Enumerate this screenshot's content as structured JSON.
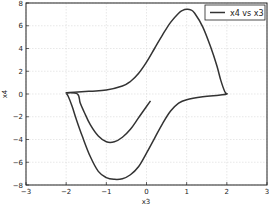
{
  "chart_data": {
    "type": "line",
    "title": "",
    "xlabel": "x3",
    "ylabel": "x4",
    "xlim": [
      -3,
      3
    ],
    "ylim": [
      -8,
      8
    ],
    "xticks": [
      -3,
      -2,
      -1,
      0,
      1,
      2,
      3
    ],
    "yticks": [
      -8,
      -6,
      -4,
      -2,
      0,
      2,
      4,
      6,
      8
    ],
    "xtick_labels": [
      "−3",
      "−2",
      "−1",
      "0",
      "1",
      "2",
      "3"
    ],
    "ytick_labels": [
      "−8",
      "−6",
      "−4",
      "−2",
      "0",
      "2",
      "4",
      "6",
      "8"
    ],
    "grid": true,
    "legend_position": "upper right",
    "series": [
      {
        "name": "x4 vs x3",
        "color": "#333333",
        "x": [
          0.1,
          0.0,
          -0.2,
          -0.4,
          -0.6,
          -0.8,
          -1.0,
          -1.2,
          -1.4,
          -1.55,
          -1.65,
          -1.72,
          -2.0,
          -1.8,
          -1.4,
          -1.0,
          -0.6,
          -0.4,
          -0.2,
          0.0,
          0.2,
          0.4,
          0.6,
          0.8,
          0.9,
          1.0,
          1.1,
          1.2,
          1.4,
          1.6,
          1.75,
          1.85,
          1.95,
          2.0,
          1.8,
          1.4,
          1.0,
          0.8,
          0.6,
          0.4,
          0.2,
          0.0,
          -0.2,
          -0.4,
          -0.6,
          -0.8,
          -1.0,
          -1.2,
          -1.4,
          -1.6,
          -1.75,
          -1.85,
          -1.95,
          -2.0
        ],
        "y": [
          -0.6,
          -1.1,
          -2.1,
          -3.1,
          -3.8,
          -4.2,
          -4.2,
          -3.7,
          -2.7,
          -1.6,
          -0.8,
          0.0,
          0.1,
          0.15,
          0.25,
          0.35,
          0.7,
          1.1,
          1.8,
          2.8,
          4.0,
          5.2,
          6.3,
          7.1,
          7.35,
          7.45,
          7.4,
          7.1,
          5.9,
          4.1,
          2.5,
          1.2,
          0.2,
          0.0,
          -0.1,
          -0.25,
          -0.5,
          -0.8,
          -1.5,
          -2.6,
          -3.9,
          -5.2,
          -6.4,
          -7.1,
          -7.45,
          -7.5,
          -7.35,
          -6.8,
          -5.5,
          -3.7,
          -2.2,
          -1.1,
          -0.2,
          0.05
        ]
      }
    ]
  }
}
